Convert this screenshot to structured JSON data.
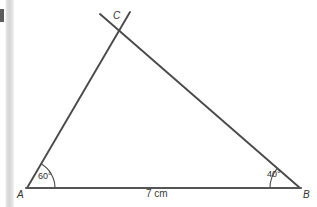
{
  "figure": {
    "type": "geometry-construction-triangle",
    "vertices": [
      {
        "name": "A",
        "label": "A",
        "x": 27,
        "y": 188
      },
      {
        "name": "B",
        "label": "B",
        "x": 300,
        "y": 188
      },
      {
        "name": "C",
        "label": "C",
        "x": 113,
        "y": 30
      }
    ],
    "angles": [
      {
        "at": "A",
        "label": "60°",
        "value": 60,
        "unit": "degrees"
      },
      {
        "at": "B",
        "label": "40°",
        "value": 40,
        "unit": "degrees"
      }
    ],
    "sides": [
      {
        "from": "A",
        "to": "B",
        "label": "7 cm",
        "value": 7,
        "unit": "cm"
      }
    ],
    "colors": {
      "ink": "#4a4a4a",
      "baseline": "#555555",
      "text": "#333333",
      "background": "#ffffff",
      "scan_band": "#d8d8d8"
    },
    "artifacts": {
      "scan_band_name": "scanner-edge-band",
      "scan_mark_name": "scanner-edge-mark"
    }
  }
}
